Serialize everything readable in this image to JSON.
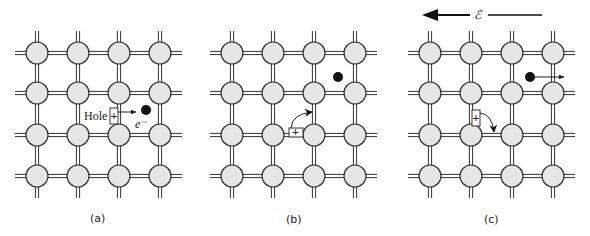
{
  "figure": {
    "field_label": "ℰ",
    "field_direction": "left",
    "panels": [
      {
        "id": "a",
        "label": "(a)",
        "origin_x": 37,
        "hole_label": "Hole",
        "hole_symbol": "+",
        "electron_label": "e⁻",
        "description": "Electron-hole pair created: electron freed from bond, leaving a hole"
      },
      {
        "id": "b",
        "label": "(b)",
        "origin_x": 232,
        "hole_symbol": "+",
        "description": "Neighboring bond electron moves into the hole"
      },
      {
        "id": "c",
        "label": "(c)",
        "origin_x": 430,
        "hole_symbol": "+",
        "description": "Under field E, electron drifts right and hole drifts opposite"
      }
    ],
    "lattice": {
      "rows": 4,
      "cols": 4,
      "spacing": 41,
      "row_y": [
        53,
        93,
        135,
        176
      ],
      "atom_radius": 11,
      "atom_fill": "#e6e6e6",
      "atom_stroke": "#333333",
      "bond_color": "#333333"
    },
    "colors": {
      "electron": "#111111",
      "arrow": "#222222",
      "text": "#222222"
    }
  }
}
